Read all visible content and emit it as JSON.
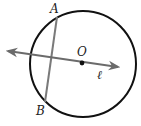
{
  "diagram": {
    "type": "geometry",
    "circle": {
      "cx": 83,
      "cy": 64,
      "r": 53,
      "stroke": "#111111",
      "stroke_width": 2
    },
    "center_point": {
      "label": "O",
      "x": 82,
      "y": 63,
      "label_x": 77,
      "label_y": 56
    },
    "line_l": {
      "label": "ℓ",
      "x1": 8,
      "y1": 51,
      "x2": 118,
      "y2": 67,
      "color": "#6b6b6b",
      "label_x": 97,
      "label_y": 79,
      "arrows": "both"
    },
    "chord_AB": {
      "x1": 57,
      "y1": 17,
      "x2": 45,
      "y2": 102,
      "color": "#7a7a7a",
      "A": {
        "label": "A",
        "x": 50,
        "y": 13
      },
      "B": {
        "label": "B",
        "x": 36,
        "y": 115
      }
    }
  }
}
